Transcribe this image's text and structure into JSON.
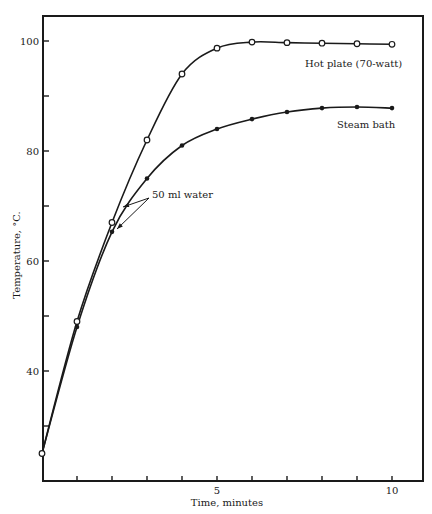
{
  "chart_data": {
    "type": "line",
    "title": "",
    "xlabel": "Time, minutes",
    "ylabel": "Temperature, °C.",
    "xlim": [
      0,
      10.7
    ],
    "ylim": [
      22.5,
      104.5
    ],
    "grid": false,
    "legend": "inline labels",
    "x_major_ticks": [
      5,
      10
    ],
    "x_minor_ticks": [
      1,
      2,
      3,
      4,
      6,
      7,
      8,
      9
    ],
    "y_major_ticks": [
      40,
      60,
      80,
      100
    ],
    "y_minor_ticks": [
      30,
      50,
      70,
      90
    ],
    "x": [
      0,
      1,
      2,
      3,
      4,
      5,
      6,
      7,
      8,
      9,
      10
    ],
    "series": [
      {
        "name": "Hot plate (70-watt)",
        "marker": "open-circle",
        "x": [
          0,
          1,
          2,
          3,
          4,
          5,
          6,
          7,
          8,
          9,
          10
        ],
        "values": [
          25,
          49,
          67,
          82,
          94,
          98.7,
          99.8,
          99.7,
          99.6,
          99.5,
          99.4
        ]
      },
      {
        "name": "Steam bath",
        "marker": "filled-dot",
        "x": [
          1,
          2,
          3,
          4,
          5,
          6,
          7,
          8,
          9,
          10
        ],
        "values": [
          48,
          65.3,
          75,
          81,
          84,
          85.8,
          87.1,
          87.8,
          88,
          87.8
        ]
      }
    ],
    "annotations": [
      {
        "text": "50 ml water",
        "arrows_to": [
          "Hot plate (70-watt) at ~2 min",
          "Steam bath at ~2 min"
        ]
      }
    ]
  },
  "labels": {
    "hot_plate": "Hot plate (70-watt)",
    "steam_bath": "Steam bath",
    "annotation": "50 ml water",
    "xlabel": "Time, minutes",
    "ylabel": "Temperature, °C."
  }
}
